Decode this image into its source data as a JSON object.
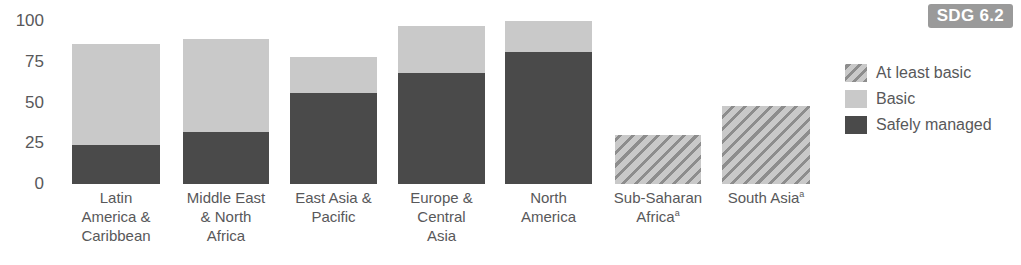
{
  "badge": {
    "label": "SDG 6.2"
  },
  "legend": {
    "position": "right",
    "items": [
      {
        "key": "at_least_basic",
        "label": "At least basic",
        "swatch": "hatched-diagonal",
        "color": "#c9c9c9"
      },
      {
        "key": "basic",
        "label": "Basic",
        "swatch": "solid",
        "color": "#c9c9c9"
      },
      {
        "key": "safely_managed",
        "label": "Safely managed",
        "swatch": "solid",
        "color": "#4a4a4a"
      }
    ]
  },
  "axis": {
    "y_ticks": [
      "100",
      "75",
      "50",
      "25",
      "0"
    ]
  },
  "chart_data": {
    "type": "bar",
    "title": "",
    "subtitle": "",
    "xlabel": "",
    "ylabel": "",
    "ylim": [
      0,
      100
    ],
    "grid": false,
    "stacked": true,
    "legend_position": "right",
    "categories": [
      "Latin America & Caribbean",
      "Middle East & North Africa",
      "East Asia & Pacific",
      "Europe & Central Asia",
      "North America",
      "Sub-Saharan Africaᵃ",
      "South Asiaᵃ"
    ],
    "category_lines": [
      [
        "Latin",
        "America &",
        "Caribbean"
      ],
      [
        "Middle East",
        "& North",
        "Africa"
      ],
      [
        "East Asia &",
        "Pacific"
      ],
      [
        "Europe &",
        "Central",
        "Asia"
      ],
      [
        "North",
        "America"
      ],
      [
        "Sub-Saharan",
        "Africa"
      ],
      [
        "South Asia"
      ]
    ],
    "category_footnotes": [
      false,
      false,
      false,
      false,
      false,
      true,
      true
    ],
    "series": [
      {
        "name": "Safely managed",
        "color": "#4a4a4a",
        "values": [
          24,
          32,
          56,
          68,
          81,
          null,
          null
        ]
      },
      {
        "name": "Basic",
        "color": "#c9c9c9",
        "values": [
          62,
          57,
          22,
          29,
          19,
          null,
          null
        ]
      },
      {
        "name": "At least basic",
        "color": "#c9c9c9",
        "pattern": "hatched",
        "values": [
          null,
          null,
          null,
          null,
          null,
          30,
          48
        ]
      }
    ],
    "totals": [
      86,
      89,
      78,
      97,
      100,
      30,
      48
    ]
  },
  "colors": {
    "safely_managed": "#4a4a4a",
    "basic": "#c9c9c9",
    "hatch_line": "#8d8d8d",
    "badge_bg": "#9a9a9a",
    "badge_text": "#ffffff",
    "text": "#58585a"
  }
}
